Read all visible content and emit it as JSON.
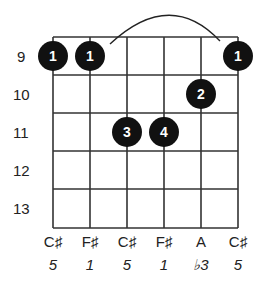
{
  "diagram": {
    "type": "guitar-chord-diagram",
    "start_fret": 9,
    "fret_labels": [
      "9",
      "10",
      "11",
      "12",
      "13"
    ],
    "strings": [
      {
        "note": "C♯",
        "degree": "5"
      },
      {
        "note": "F♯",
        "degree": "1"
      },
      {
        "note": "C♯",
        "degree": "5"
      },
      {
        "note": "F♯",
        "degree": "1"
      },
      {
        "note": "A",
        "degree": "♭3"
      },
      {
        "note": "C♯",
        "degree": "5"
      }
    ],
    "fingers": [
      {
        "string": 1,
        "fret_row": 1,
        "finger": "1"
      },
      {
        "string": 2,
        "fret_row": 1,
        "finger": "1"
      },
      {
        "string": 6,
        "fret_row": 1,
        "finger": "1"
      },
      {
        "string": 5,
        "fret_row": 2,
        "finger": "2"
      },
      {
        "string": 3,
        "fret_row": 3,
        "finger": "3"
      },
      {
        "string": 4,
        "fret_row": 3,
        "finger": "4"
      }
    ],
    "barre": {
      "from_string": 2,
      "to_string": 6,
      "fret_row": 1,
      "finger": "1"
    },
    "colors": {
      "grid": "#333333",
      "dot": "#111111",
      "dot_text": "#ffffff",
      "label": "#222222"
    }
  }
}
